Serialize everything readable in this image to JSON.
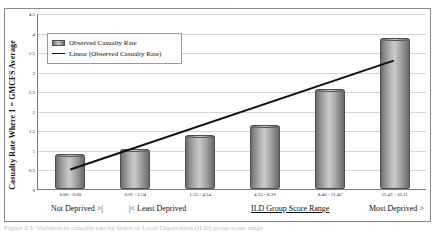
{
  "figure": {
    "top_clipped_caption": "· · · · · ·",
    "bottom_clipped_caption": "Figure 2.3: Variation in casualty rate by Index of Local Deprivation (ILD) group score range"
  },
  "legend": {
    "series_label": "Observed Casualty Rate",
    "trend_label": "Linear (Observed Casualty Rate)"
  },
  "axis": {
    "y_title": "Casualty Rate Where 1 = GMCFS Average",
    "x_left_label": "Not Deprived >|",
    "x_left2_label": "|< Least Deprived",
    "x_center_label": "ILD Group Score Range",
    "x_right_label": "Most Deprived >"
  },
  "chart_data": {
    "type": "bar",
    "title": "",
    "xlabel": "ILD Group Score Range",
    "ylabel": "Casualty Rate Where 1 = GMCFS Average",
    "categories": [
      "0.00 - 0.00",
      "0.01 - 1.54",
      "1.55 - 4.54",
      "4.55 - 8.39",
      "8.40 - 11.42",
      "11.43 - 16.11"
    ],
    "values": [
      0.9,
      1.03,
      1.37,
      1.63,
      2.55,
      3.85
    ],
    "series": [
      {
        "name": "Observed Casualty Rate",
        "values": [
          0.9,
          1.03,
          1.37,
          1.63,
          2.55,
          3.85
        ]
      }
    ],
    "trendline": {
      "name": "Linear (Observed Casualty Rate)",
      "start_value": 0.5,
      "end_value": 3.3
    },
    "ylim": [
      0,
      4.5
    ],
    "yticks": [
      "0",
      "0.5",
      "1",
      "1.5",
      "2",
      "2.5",
      "3",
      "3.5",
      "4",
      "4.5"
    ],
    "ytick_values": [
      0,
      0.5,
      1,
      1.5,
      2,
      2.5,
      3,
      3.5,
      4,
      4.5
    ],
    "grid": true,
    "legend_position": "upper left"
  },
  "colors": {
    "bar_fill_light": "#c9c9c9",
    "bar_fill_dark": "#6a6a6a",
    "bar_border": "#4f4f4f",
    "trendline": "#111111",
    "gridline": "#d6d6d6",
    "axis": "#7a7a7a",
    "frame": "#8a8a8a"
  }
}
